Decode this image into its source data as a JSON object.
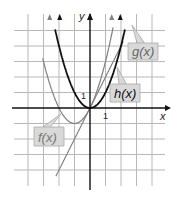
{
  "chart_data": {
    "type": "line",
    "title": "",
    "xlabel": "x",
    "ylabel": "y",
    "xlim": [
      -4,
      4
    ],
    "ylim": [
      -4,
      5
    ],
    "grid": true,
    "tick_labels": {
      "x": [
        "1"
      ],
      "y": [
        "1"
      ]
    },
    "series": [
      {
        "name": "f(x)",
        "expression": "x^2 + 2x",
        "color": "#808080",
        "label_pos": [
          -3.4,
          -2
        ]
      },
      {
        "name": "g(x)",
        "expression": "2x",
        "color": "#808080",
        "label_pos": [
          3.1,
          3.8
        ]
      },
      {
        "name": "h(x)",
        "expression": "x^2",
        "color": "#111111",
        "label_pos": [
          2.5,
          1
        ]
      }
    ]
  },
  "axis": {
    "x_label": "x",
    "y_label": "y",
    "x_tick": "1",
    "y_tick": "1"
  },
  "labels": {
    "f": "f(x)",
    "g": "g(x)",
    "h": "h(x)"
  }
}
